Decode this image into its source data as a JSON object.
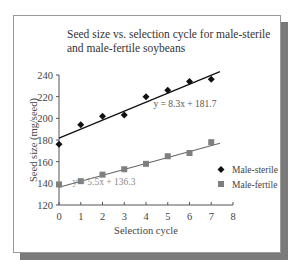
{
  "chart_data": {
    "type": "scatter",
    "title": "Seed size vs. selection cycle for male-sterile and male-fertile soybeans",
    "xlabel": "Selection cycle",
    "ylabel": "Seed size (mg/seed)",
    "xlim": [
      0,
      8
    ],
    "ylim": [
      120,
      240
    ],
    "x_ticks": [
      0,
      1,
      2,
      3,
      4,
      5,
      6,
      7,
      8
    ],
    "y_ticks": [
      120,
      140,
      160,
      180,
      200,
      220,
      240
    ],
    "grid": false,
    "legend_position": "right",
    "x": [
      0,
      1,
      2,
      3,
      4,
      5,
      6,
      7
    ],
    "series": [
      {
        "name": "Male-sterile",
        "marker": "diamond",
        "color": "#111111",
        "values": [
          176,
          194,
          202,
          203,
          220,
          226,
          234,
          236
        ],
        "trendline": {
          "slope": 8.3,
          "intercept": 181.7,
          "label": "y = 8.3x + 181.7"
        }
      },
      {
        "name": "Male-fertile",
        "marker": "square",
        "color": "#7f7f7f",
        "values": [
          139,
          142,
          148,
          153,
          158,
          165,
          168,
          178
        ],
        "trendline": {
          "slope": 5.5,
          "intercept": 136.3,
          "label": "y = 5.5x + 136.3"
        }
      }
    ]
  },
  "title_text": "Seed size vs. selection cycle for male-sterile and male-fertile soybeans"
}
